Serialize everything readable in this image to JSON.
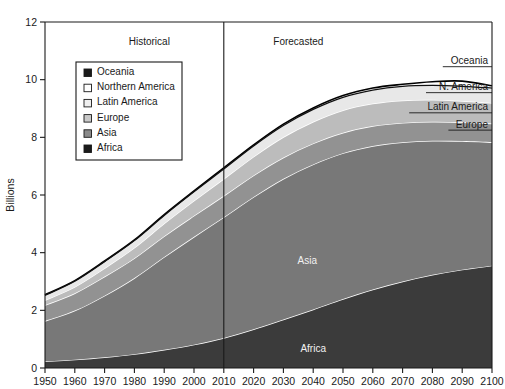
{
  "chart_data": {
    "type": "area",
    "title": "",
    "xlabel": "",
    "ylabel": "Billions",
    "xlim": [
      1950,
      2100
    ],
    "ylim": [
      0,
      12
    ],
    "ytick_step": 2,
    "grid": false,
    "legend_position": "upper-left-inside",
    "x": [
      1950,
      1960,
      1970,
      1980,
      1990,
      2000,
      2010,
      2020,
      2030,
      2040,
      2050,
      2060,
      2070,
      2080,
      2090,
      2100
    ],
    "xticklabels": [
      "1950",
      "1960",
      "1970",
      "1980",
      "1990",
      "2000",
      "2010",
      "2020",
      "2030",
      "2040",
      "2050",
      "2060",
      "2070",
      "2080",
      "2090",
      "2100"
    ],
    "yticklabels": [
      "0",
      "2",
      "4",
      "6",
      "8",
      "10",
      "12"
    ],
    "stack_order_bottom_to_top": [
      "Africa",
      "Asia",
      "Europe",
      "Latin America",
      "Northern America",
      "Oceania"
    ],
    "series": [
      {
        "name": "Africa",
        "color": "#3b3b3b",
        "values": [
          0.23,
          0.29,
          0.37,
          0.48,
          0.63,
          0.81,
          1.04,
          1.34,
          1.68,
          2.03,
          2.39,
          2.72,
          3.0,
          3.23,
          3.41,
          3.55
        ]
      },
      {
        "name": "Asia",
        "color": "#787878",
        "values": [
          1.4,
          1.7,
          2.14,
          2.64,
          3.22,
          3.74,
          4.19,
          4.59,
          4.88,
          5.03,
          5.06,
          4.98,
          4.83,
          4.65,
          4.46,
          4.28
        ]
      },
      {
        "name": "Europe",
        "color": "#929292",
        "values": [
          0.55,
          0.6,
          0.66,
          0.69,
          0.72,
          0.73,
          0.74,
          0.75,
          0.74,
          0.73,
          0.71,
          0.69,
          0.67,
          0.66,
          0.65,
          0.65
        ]
      },
      {
        "name": "Latin America",
        "color": "#bcbcbc",
        "values": [
          0.17,
          0.22,
          0.29,
          0.36,
          0.44,
          0.52,
          0.59,
          0.65,
          0.71,
          0.75,
          0.78,
          0.78,
          0.78,
          0.76,
          0.74,
          0.71
        ]
      },
      {
        "name": "Northern America",
        "color": "#e8e8e8",
        "values": [
          0.17,
          0.2,
          0.23,
          0.25,
          0.28,
          0.31,
          0.34,
          0.37,
          0.4,
          0.43,
          0.45,
          0.47,
          0.49,
          0.5,
          0.51,
          0.52
        ]
      },
      {
        "name": "Oceania",
        "color": "#fafafa",
        "values": [
          0.013,
          0.016,
          0.02,
          0.023,
          0.027,
          0.031,
          0.037,
          0.043,
          0.049,
          0.055,
          0.06,
          0.065,
          0.069,
          0.073,
          0.076,
          0.079
        ]
      }
    ],
    "totals": [
      2.54,
      3.03,
      3.71,
      4.44,
      5.32,
      6.14,
      6.94,
      7.74,
      8.46,
      9.02,
      9.45,
      9.71,
      9.84,
      9.93,
      9.95,
      9.79
    ],
    "annotations": [
      {
        "text": "Historical",
        "x_value": 1985,
        "y_value": 11.2
      },
      {
        "text": "Forecasted",
        "x_value": 2035,
        "y_value": 11.2
      }
    ],
    "divider": {
      "x_value": 2010,
      "label_left": "Historical",
      "label_right": "Forecasted"
    },
    "inline_labels": [
      {
        "text": "Asia",
        "x_value": 2038,
        "y_value": 3.6,
        "tone": "light"
      },
      {
        "text": "Africa",
        "x_value": 2040,
        "y_value": 0.55,
        "tone": "light"
      }
    ],
    "right_labels": [
      {
        "text": "Oceania",
        "y_value": 10.45
      },
      {
        "text": "N. America",
        "y_value": 9.55
      },
      {
        "text": "Latin America",
        "y_value": 8.85
      },
      {
        "text": "Europe",
        "y_value": 8.25
      }
    ]
  },
  "legend": {
    "title": "",
    "items": [
      {
        "label": "Oceania",
        "swatch": "#1a1a1a"
      },
      {
        "label": "Northern America",
        "swatch": "#ffffff"
      },
      {
        "label": "Latin America",
        "swatch": "#efefef"
      },
      {
        "label": "Europe",
        "swatch": "#c9c9c9"
      },
      {
        "label": "Asia",
        "swatch": "#8a8a8a"
      },
      {
        "label": "Africa",
        "swatch": "#1a1a1a"
      }
    ]
  },
  "colors": {
    "axis": "#1a1a1a",
    "background": "#ffffff",
    "outline": "#000000",
    "band_separator": "#ffffff"
  }
}
